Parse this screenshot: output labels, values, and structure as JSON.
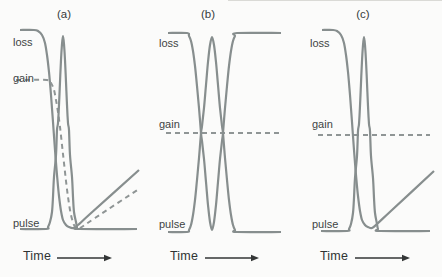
{
  "figure": {
    "background": "#fbfbfa",
    "curve_color": "#878e8e",
    "dashed_color": "#8f9595",
    "axis_color": "#333636",
    "label_color": "#3e4444",
    "dash_pattern": "5 4"
  },
  "chart_data": [
    {
      "id": "a",
      "type": "line",
      "title": "(a)",
      "xlabel": "Time",
      "axes": "schematic, no numeric ticks; coordinates below are pixel positions in the 442x277 image",
      "curves": [
        {
          "name": "loss",
          "style": "solid",
          "shape": "starts high, saturates down during pulse, recovers linearly",
          "points": [
            [
              20,
              30
            ],
            [
              34,
              30
            ],
            [
              38,
              31
            ],
            [
              42,
              35
            ],
            [
              45,
              43
            ],
            [
              47,
              55
            ],
            [
              49,
              72
            ],
            [
              51,
              95
            ],
            [
              53,
              122
            ],
            [
              55,
              150
            ],
            [
              57,
              175
            ],
            [
              59,
              196
            ],
            [
              61,
              211
            ],
            [
              63,
              220
            ],
            [
              66,
              225
            ],
            [
              69,
              227
            ],
            [
              73,
              228
            ],
            [
              78,
              225
            ],
            [
              90,
              214
            ],
            [
              139,
              170
            ]
          ]
        },
        {
          "name": "gain",
          "style": "dashed",
          "shape": "flat at mid level, depleted by pulse, slow linear recovery",
          "points": [
            [
              16,
              80
            ],
            [
              47,
              80
            ],
            [
              51,
              83
            ],
            [
              54,
              90
            ],
            [
              56,
              100
            ],
            [
              58,
              112
            ],
            [
              60,
              127
            ],
            [
              62,
              145
            ],
            [
              64,
              163
            ],
            [
              66,
              181
            ],
            [
              68,
              197
            ],
            [
              70,
              210
            ],
            [
              72,
              219
            ],
            [
              74,
              225
            ],
            [
              77,
              228
            ],
            [
              80,
              228
            ],
            [
              95,
              218
            ],
            [
              139,
              189
            ]
          ]
        },
        {
          "name": "pulse",
          "style": "solid",
          "shape": "narrow peak",
          "points": [
            [
              20,
              229
            ],
            [
              46,
              229
            ],
            [
              48,
              227
            ],
            [
              50,
              222
            ],
            [
              52,
              212
            ],
            [
              53,
              197
            ],
            [
              54,
              177
            ],
            [
              56,
              155
            ],
            [
              57,
              130
            ],
            [
              58,
              123
            ],
            [
              59,
              105
            ],
            [
              60,
              82
            ],
            [
              61,
              60
            ],
            [
              62,
              44
            ],
            [
              63,
              36
            ],
            [
              64,
              44
            ],
            [
              65,
              60
            ],
            [
              66,
              82
            ],
            [
              67,
              105
            ],
            [
              68,
              123
            ],
            [
              69,
              130
            ],
            [
              70,
              155
            ],
            [
              72,
              177
            ],
            [
              73,
              197
            ],
            [
              74,
              212
            ],
            [
              76,
              222
            ],
            [
              77,
              227
            ],
            [
              79,
              229
            ],
            [
              137,
              229
            ]
          ]
        }
      ],
      "arrow": {
        "x1": 57,
        "x2": 112,
        "y": 258
      }
    },
    {
      "id": "b",
      "type": "line",
      "title": "(b)",
      "xlabel": "Time",
      "axes": "schematic, no numeric ticks",
      "curves": [
        {
          "name": "loss",
          "style": "solid",
          "shape": "high plateau with narrow dip mirroring the pulse, full fast recovery",
          "points": [
            [
              168,
              33
            ],
            [
              187,
              33
            ],
            [
              189,
              36
            ],
            [
              191,
              41
            ],
            [
              193,
              51
            ],
            [
              195,
              66
            ],
            [
              197,
              86
            ],
            [
              199,
              108
            ],
            [
              201,
              133
            ],
            [
              202,
              141
            ],
            [
              204,
              159
            ],
            [
              206,
              182
            ],
            [
              208,
              205
            ],
            [
              210,
              222
            ],
            [
              212,
              230
            ],
            [
              214,
              222
            ],
            [
              216,
              205
            ],
            [
              218,
              182
            ],
            [
              220,
              159
            ],
            [
              222,
              141
            ],
            [
              223,
              133
            ],
            [
              225,
              108
            ],
            [
              227,
              86
            ],
            [
              229,
              66
            ],
            [
              231,
              51
            ],
            [
              233,
              41
            ],
            [
              235,
              36
            ],
            [
              237,
              33
            ],
            [
              281,
              33
            ]
          ]
        },
        {
          "name": "gain",
          "style": "dashed",
          "shape": "constant mid level",
          "points": [
            [
              166,
              133
            ],
            [
              282,
              133
            ]
          ]
        },
        {
          "name": "pulse",
          "style": "solid",
          "shape": "narrow peak",
          "points": [
            [
              168,
              232
            ],
            [
              187,
              232
            ],
            [
              189,
              230
            ],
            [
              191,
              225
            ],
            [
              193,
              215
            ],
            [
              195,
              200
            ],
            [
              197,
              180
            ],
            [
              199,
              158
            ],
            [
              201,
              133
            ],
            [
              202,
              126
            ],
            [
              204,
              108
            ],
            [
              206,
              85
            ],
            [
              208,
              62
            ],
            [
              210,
              45
            ],
            [
              212,
              37
            ],
            [
              214,
              45
            ],
            [
              216,
              62
            ],
            [
              218,
              85
            ],
            [
              220,
              108
            ],
            [
              222,
              126
            ],
            [
              223,
              133
            ],
            [
              225,
              158
            ],
            [
              227,
              180
            ],
            [
              229,
              200
            ],
            [
              231,
              215
            ],
            [
              233,
              225
            ],
            [
              235,
              230
            ],
            [
              237,
              232
            ],
            [
              281,
              232
            ]
          ]
        }
      ],
      "arrow": {
        "x1": 205,
        "x2": 259,
        "y": 258
      }
    },
    {
      "id": "c",
      "type": "line",
      "title": "(c)",
      "xlabel": "Time",
      "axes": "schematic, no numeric ticks",
      "curves": [
        {
          "name": "loss",
          "style": "solid",
          "shape": "starts high, saturates down during pulse, slow linear recovery",
          "points": [
            [
              322,
              30
            ],
            [
              333,
              30
            ],
            [
              337,
              31
            ],
            [
              341,
              35
            ],
            [
              344,
              43
            ],
            [
              346,
              55
            ],
            [
              348,
              72
            ],
            [
              350,
              95
            ],
            [
              352,
              122
            ],
            [
              354,
              150
            ],
            [
              356,
              175
            ],
            [
              358,
              196
            ],
            [
              360,
              211
            ],
            [
              362,
              220
            ],
            [
              365,
              225
            ],
            [
              368,
              227
            ],
            [
              372,
              228
            ],
            [
              377,
              224
            ],
            [
              392,
              210
            ],
            [
              434,
              171
            ]
          ]
        },
        {
          "name": "gain",
          "style": "dashed",
          "shape": "constant mid level",
          "points": [
            [
              318,
              135
            ],
            [
              430,
              135
            ]
          ]
        },
        {
          "name": "pulse",
          "style": "solid",
          "shape": "narrow peak",
          "points": [
            [
              321,
              231
            ],
            [
              347,
              231
            ],
            [
              349,
              229
            ],
            [
              351,
              224
            ],
            [
              353,
              213
            ],
            [
              354,
              198
            ],
            [
              355,
              178
            ],
            [
              357,
              156
            ],
            [
              358,
              131
            ],
            [
              359,
              124
            ],
            [
              360,
              106
            ],
            [
              361,
              83
            ],
            [
              362,
              61
            ],
            [
              363,
              45
            ],
            [
              364,
              37
            ],
            [
              365,
              45
            ],
            [
              366,
              61
            ],
            [
              367,
              83
            ],
            [
              368,
              106
            ],
            [
              369,
              124
            ],
            [
              370,
              131
            ],
            [
              371,
              156
            ],
            [
              373,
              178
            ],
            [
              374,
              198
            ],
            [
              375,
              213
            ],
            [
              377,
              224
            ],
            [
              378,
              229
            ],
            [
              380,
              231
            ],
            [
              430,
              231
            ]
          ]
        }
      ],
      "arrow": {
        "x1": 355,
        "x2": 410,
        "y": 258
      }
    }
  ]
}
